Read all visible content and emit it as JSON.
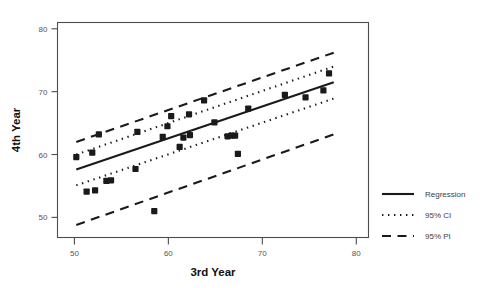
{
  "chart_data": {
    "type": "scatter",
    "title": "",
    "xlabel": "3rd Year",
    "ylabel": "4th Year",
    "xlim": [
      48.2,
      81.3
    ],
    "ylim": [
      46.8,
      81.0
    ],
    "xticks": [
      50,
      60,
      70,
      80
    ],
    "yticks": [
      50,
      60,
      70,
      80
    ],
    "xtick_labels": [
      "50",
      "60",
      "70",
      "80"
    ],
    "ytick_labels": [
      "50",
      "60",
      "70",
      "80"
    ],
    "grid": false,
    "legend_position": "right-outside",
    "points": [
      {
        "x": 50.2,
        "y": 59.6
      },
      {
        "x": 51.3,
        "y": 54.1
      },
      {
        "x": 51.9,
        "y": 60.3
      },
      {
        "x": 52.2,
        "y": 54.3
      },
      {
        "x": 52.6,
        "y": 63.2
      },
      {
        "x": 53.4,
        "y": 55.8
      },
      {
        "x": 53.9,
        "y": 55.9
      },
      {
        "x": 56.5,
        "y": 57.7
      },
      {
        "x": 56.7,
        "y": 63.6
      },
      {
        "x": 58.5,
        "y": 51.0
      },
      {
        "x": 59.4,
        "y": 62.8
      },
      {
        "x": 59.9,
        "y": 64.5
      },
      {
        "x": 60.3,
        "y": 66.1
      },
      {
        "x": 61.2,
        "y": 61.2
      },
      {
        "x": 61.6,
        "y": 62.7
      },
      {
        "x": 62.2,
        "y": 66.4
      },
      {
        "x": 62.3,
        "y": 63.1
      },
      {
        "x": 63.8,
        "y": 68.6
      },
      {
        "x": 64.9,
        "y": 65.1
      },
      {
        "x": 66.3,
        "y": 62.9
      },
      {
        "x": 66.7,
        "y": 63.0
      },
      {
        "x": 67.1,
        "y": 63.0
      },
      {
        "x": 67.4,
        "y": 60.1
      },
      {
        "x": 68.5,
        "y": 67.3
      },
      {
        "x": 72.4,
        "y": 69.5
      },
      {
        "x": 74.6,
        "y": 69.1
      },
      {
        "x": 76.5,
        "y": 70.2
      },
      {
        "x": 77.1,
        "y": 72.9
      }
    ],
    "series": [
      {
        "name": "Regression",
        "style": "solid",
        "line": {
          "x1": 50.2,
          "y1": 57.6,
          "x2": 77.6,
          "y2": 71.5
        }
      },
      {
        "name": "95% CI",
        "style": "dotted",
        "upper": {
          "x1": 50.2,
          "y1": 60.0,
          "x2": 77.6,
          "y2": 74.0
        },
        "lower": {
          "x1": 50.2,
          "y1": 55.1,
          "x2": 77.6,
          "y2": 68.9
        }
      },
      {
        "name": "95% PI",
        "style": "dashed",
        "upper": {
          "x1": 50.2,
          "y1": 62.0,
          "x2": 77.6,
          "y2": 76.2
        },
        "lower": {
          "x1": 50.2,
          "y1": 48.8,
          "x2": 77.6,
          "y2": 63.2
        }
      }
    ]
  },
  "legend": {
    "items": [
      {
        "label": "Regression",
        "style": "solid"
      },
      {
        "label": "95% CI",
        "style": "dotted"
      },
      {
        "label": "95% PI",
        "style": "dashed"
      }
    ]
  }
}
